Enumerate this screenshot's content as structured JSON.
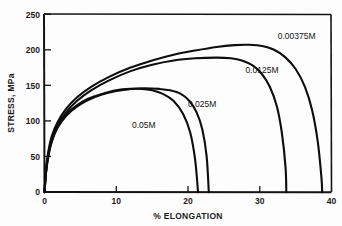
{
  "chart_data": {
    "type": "line",
    "title": "",
    "xlabel": "% ELONGATION",
    "ylabel": "STRESS, MPa",
    "xlim": [
      0,
      40
    ],
    "ylim": [
      0,
      250
    ],
    "xticks": [
      "0",
      "10",
      "20",
      "30",
      "40"
    ],
    "xtick_values": [
      0,
      10,
      20,
      30,
      40
    ],
    "yticks": [
      "0",
      "50",
      "100",
      "150",
      "200",
      "250"
    ],
    "ytick_values": [
      0,
      50,
      100,
      150,
      200,
      250
    ],
    "grid": false,
    "legend_position": "inline-annotations",
    "series": [
      {
        "name": "0.00375M",
        "label": "0.00375M",
        "peak_stress": 207,
        "peak_elongation": 27.5,
        "fracture_elongation": 38.6,
        "points": [
          [
            0,
            0
          ],
          [
            0.2,
            30
          ],
          [
            0.5,
            55
          ],
          [
            1.0,
            78
          ],
          [
            1.8,
            98
          ],
          [
            3.0,
            117
          ],
          [
            4.5,
            133
          ],
          [
            6.5,
            148
          ],
          [
            9.0,
            162
          ],
          [
            12.0,
            175
          ],
          [
            15.0,
            185
          ],
          [
            18.0,
            193
          ],
          [
            21.0,
            199
          ],
          [
            24.0,
            204
          ],
          [
            26.5,
            206.5
          ],
          [
            28.5,
            207
          ],
          [
            30.5,
            205
          ],
          [
            32.0,
            200
          ],
          [
            33.5,
            190
          ],
          [
            35.0,
            173
          ],
          [
            36.3,
            148
          ],
          [
            37.3,
            115
          ],
          [
            38.1,
            70
          ],
          [
            38.6,
            20
          ],
          [
            38.7,
            0
          ]
        ]
      },
      {
        "name": "0.0125M",
        "label": "0.0125M",
        "peak_stress": 189,
        "peak_elongation": 25.0,
        "fracture_elongation": 33.7,
        "points": [
          [
            0,
            0
          ],
          [
            0.2,
            28
          ],
          [
            0.5,
            52
          ],
          [
            1.0,
            74
          ],
          [
            1.8,
            94
          ],
          [
            3.0,
            112
          ],
          [
            4.5,
            128
          ],
          [
            6.5,
            143
          ],
          [
            9.0,
            157
          ],
          [
            12.0,
            170
          ],
          [
            15.0,
            179
          ],
          [
            18.0,
            185
          ],
          [
            21.0,
            188
          ],
          [
            24.0,
            189
          ],
          [
            26.0,
            188
          ],
          [
            27.5,
            185
          ],
          [
            29.0,
            178
          ],
          [
            30.3,
            166
          ],
          [
            31.4,
            148
          ],
          [
            32.4,
            120
          ],
          [
            33.1,
            82
          ],
          [
            33.6,
            34
          ],
          [
            33.7,
            0
          ]
        ]
      },
      {
        "name": "0.025M",
        "label": "0.025M",
        "peak_stress": 146,
        "peak_elongation": 13.5,
        "fracture_elongation": 22.9,
        "points": [
          [
            0,
            0
          ],
          [
            0.2,
            26
          ],
          [
            0.5,
            48
          ],
          [
            1.0,
            70
          ],
          [
            1.8,
            90
          ],
          [
            3.0,
            107
          ],
          [
            4.5,
            120
          ],
          [
            6.0,
            129
          ],
          [
            8.0,
            137
          ],
          [
            10.0,
            142
          ],
          [
            12.0,
            145
          ],
          [
            14.0,
            146
          ],
          [
            16.0,
            145
          ],
          [
            17.5,
            143
          ],
          [
            19.0,
            138
          ],
          [
            20.2,
            128
          ],
          [
            21.2,
            112
          ],
          [
            22.0,
            88
          ],
          [
            22.6,
            50
          ],
          [
            22.9,
            0
          ]
        ]
      },
      {
        "name": "0.05M",
        "label": "0.05M",
        "peak_stress": 145,
        "peak_elongation": 13.0,
        "fracture_elongation": 21.4,
        "points": [
          [
            0,
            0
          ],
          [
            0.2,
            27
          ],
          [
            0.5,
            50
          ],
          [
            1.0,
            72
          ],
          [
            1.8,
            92
          ],
          [
            3.0,
            109
          ],
          [
            4.5,
            122
          ],
          [
            6.0,
            131
          ],
          [
            8.0,
            138
          ],
          [
            10.0,
            143
          ],
          [
            12.0,
            145
          ],
          [
            13.5,
            145
          ],
          [
            15.0,
            143
          ],
          [
            16.5,
            138
          ],
          [
            18.0,
            128
          ],
          [
            19.3,
            110
          ],
          [
            20.3,
            84
          ],
          [
            21.0,
            45
          ],
          [
            21.4,
            0
          ]
        ]
      }
    ],
    "annotations": [
      {
        "text": "0.00375M",
        "x": 32.5,
        "y": 215
      },
      {
        "text": "0.0125M",
        "x": 28.0,
        "y": 168
      },
      {
        "text": "0.025M",
        "x": 20.0,
        "y": 120
      },
      {
        "text": "0.05M",
        "x": 12.2,
        "y": 90
      }
    ]
  }
}
